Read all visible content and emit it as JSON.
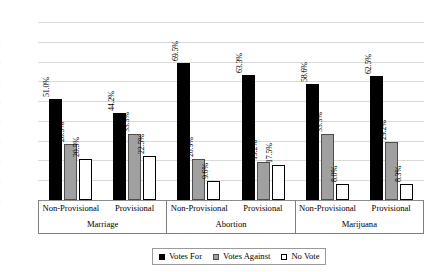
{
  "chart_data": {
    "type": "bar",
    "title": "",
    "xlabel": "",
    "ylabel": "",
    "ylim": [
      0,
      90
    ],
    "ytick_labels": [
      "90.0%",
      "80.0%",
      "70.0%",
      "60.0%",
      "50.0%",
      "40.0%",
      "30.0%",
      "20.0%",
      "10.0%",
      "0.0%"
    ],
    "ytick_values": [
      90,
      80,
      70,
      60,
      50,
      40,
      30,
      20,
      10,
      0
    ],
    "grid": true,
    "legend_position": "bottom",
    "group_labels": [
      "Marriage",
      "Abortion",
      "Marijuana"
    ],
    "categories": [
      "Non-Provisional",
      "Provisional",
      "Non-Provisional",
      "Provisional",
      "Non-Provisional",
      "Provisional"
    ],
    "series": [
      {
        "name": "Votes For",
        "color": "#000000",
        "values": [
          51.0,
          44.2,
          69.5,
          63.3,
          58.6,
          62.5
        ],
        "labels": [
          "51.0%",
          "44.2%",
          "69.5%",
          "63.3%",
          "58.6%",
          "62.5%"
        ]
      },
      {
        "name": "Votes Against",
        "color": "#a0a0a0",
        "values": [
          28.5,
          33.3,
          20.9,
          19.2,
          33.3,
          29.2
        ],
        "labels": [
          "28.5%",
          "33.3%",
          "20.9%",
          "19.2%",
          "33.3%",
          "29.2%"
        ]
      },
      {
        "name": "No Vote",
        "color": "#ffffff",
        "values": [
          20.5,
          22.5,
          9.6,
          17.5,
          8.0,
          8.3
        ],
        "labels": [
          "20.5%",
          "22.5%",
          "9.6%",
          "17.5%",
          "8.0%",
          "8.3%"
        ]
      }
    ]
  },
  "axis": {
    "ticks": [
      {
        "label": "90.0%"
      },
      {
        "label": "80.0%"
      },
      {
        "label": "70.0%"
      },
      {
        "label": "60.0%"
      },
      {
        "label": "50.0%"
      },
      {
        "label": "40.0%"
      },
      {
        "label": "30.0%"
      },
      {
        "label": "20.0%"
      },
      {
        "label": "10.0%"
      },
      {
        "label": "0.0%"
      }
    ],
    "groups": [
      {
        "label": "Marriage",
        "subs": [
          {
            "label": "Non-Provisional"
          },
          {
            "label": "Provisional"
          }
        ]
      },
      {
        "label": "Abortion",
        "subs": [
          {
            "label": "Non-Provisional"
          },
          {
            "label": "Provisional"
          }
        ]
      },
      {
        "label": "Marijuana",
        "subs": [
          {
            "label": "Non-Provisional"
          },
          {
            "label": "Provisional"
          }
        ]
      }
    ]
  },
  "legend": {
    "items": [
      {
        "label": "Votes For"
      },
      {
        "label": "Votes Against"
      },
      {
        "label": "No Vote"
      }
    ]
  }
}
